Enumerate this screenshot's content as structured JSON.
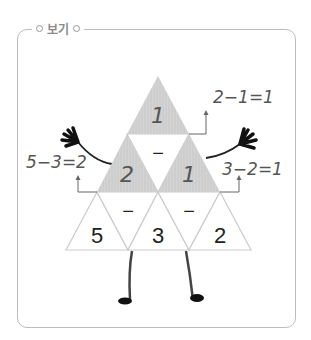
{
  "legend": {
    "label": "보기"
  },
  "pyramid": {
    "top": {
      "value": "1",
      "shaded": true
    },
    "middle": [
      {
        "value": "2",
        "shaded": true
      },
      {
        "value": "1",
        "shaded": true
      }
    ],
    "middle_operator": "−",
    "bottom": [
      {
        "value": "5"
      },
      {
        "value": "3"
      },
      {
        "value": "2"
      }
    ],
    "bottom_operators": [
      "−",
      "−"
    ]
  },
  "annotations": {
    "top": "2−1=1",
    "left": "5−3=2",
    "right": "3−2=1"
  },
  "colors": {
    "shade": "#cfcfcf",
    "outline": "#cccccc",
    "frame": "#bdbdbd",
    "ink": "#222222"
  }
}
